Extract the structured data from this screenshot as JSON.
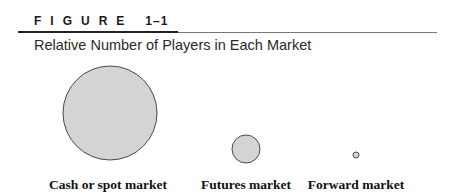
{
  "figure": {
    "label": "FIGURE",
    "number": "1–1",
    "title": "Relative Number of Players in Each Market"
  },
  "markets": [
    {
      "name": "Cash or spot market",
      "relative_size": "large",
      "circle": {
        "cx": 110,
        "cy": 113,
        "r": 47
      }
    },
    {
      "name": "Futures market",
      "relative_size": "medium",
      "circle": {
        "cx": 246,
        "cy": 149,
        "r": 14
      }
    },
    {
      "name": "Forward market",
      "relative_size": "small",
      "circle": {
        "cx": 356,
        "cy": 155,
        "r": 3
      }
    }
  ],
  "colors": {
    "circle_fill": "#d4d4d4",
    "circle_stroke": "#4a4a4a",
    "rule": "#222222"
  }
}
